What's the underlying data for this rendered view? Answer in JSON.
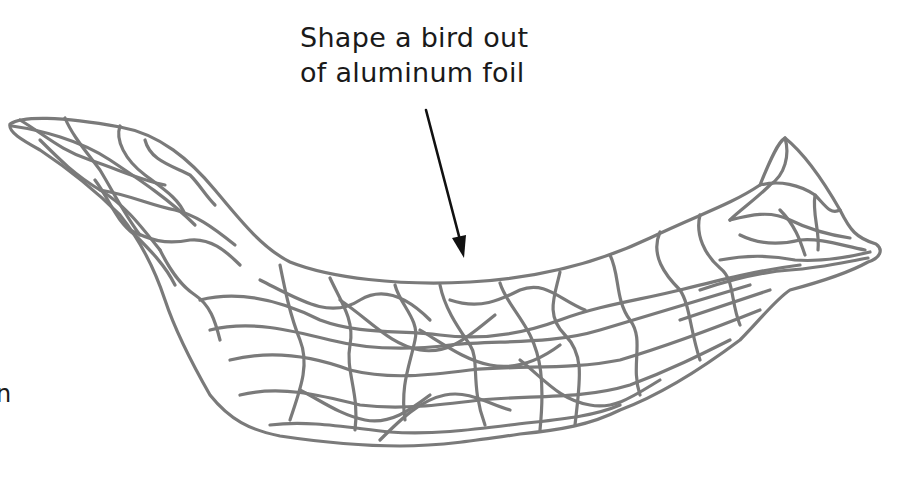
{
  "annotation": {
    "line1": "Shape a bird out",
    "line2": "of aluminum foil"
  },
  "edge_fragment": "n",
  "illustration": {
    "subject": "aluminum-foil-bird-body",
    "stroke_color": "#7a7a7a",
    "arrow_color": "#111111"
  }
}
